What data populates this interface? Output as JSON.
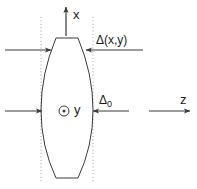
{
  "figure": {
    "kind": "optical-lens-cross-section-diagram",
    "background_color": "#ffffff",
    "line_color": "#3a3a3a",
    "dotted_line_color": "#9a9a9a",
    "text_color": "#1a1a1a"
  },
  "axes": {
    "x_axis": {
      "label": "x",
      "direction": "up",
      "arrow_from": [
        66,
        36
      ],
      "arrow_to": [
        66,
        6
      ]
    },
    "z_axis": {
      "label": "z",
      "direction": "right",
      "arrow_from": [
        149,
        111
      ],
      "arrow_to": [
        191,
        111
      ]
    },
    "y_axis": {
      "label": "y",
      "icon": "circle-dot-out-of-page-icon",
      "direction": "out-of-page",
      "position": [
        64,
        111
      ]
    }
  },
  "annotations": {
    "delta_xy": {
      "label_delta": "Δ",
      "label_args": "(x,y)",
      "label_full": "Δ(x,y)",
      "leader_y": 50,
      "leader_from_x": 143,
      "leader_to_x": 86
    },
    "delta_0": {
      "label_delta": "Δ",
      "label_subscript": "0",
      "label_full": "Δ0",
      "leader_y": 111,
      "leader_from_x": 129,
      "leader_to_x": 93
    }
  },
  "rays": [
    {
      "name": "upper-incoming-ray",
      "y": 50,
      "from_x": 5,
      "to_x": 51
    },
    {
      "name": "axial-incoming-ray",
      "y": 111,
      "from_x": 5,
      "to_x": 42
    }
  ],
  "guides": {
    "left_dotted_line_x": 41,
    "right_dotted_line_x": 93,
    "dotted_top_y": 17,
    "dotted_bottom_y": 183
  },
  "lens": {
    "name": "biconvex-lens",
    "center_x": 66,
    "top_flat_y": 38,
    "bottom_flat_y": 178,
    "top_flat_left_x": 56,
    "top_flat_right_x": 78,
    "bottom_flat_left_x": 56,
    "bottom_flat_right_x": 78,
    "max_half_width": 26,
    "widest_y": 110
  }
}
